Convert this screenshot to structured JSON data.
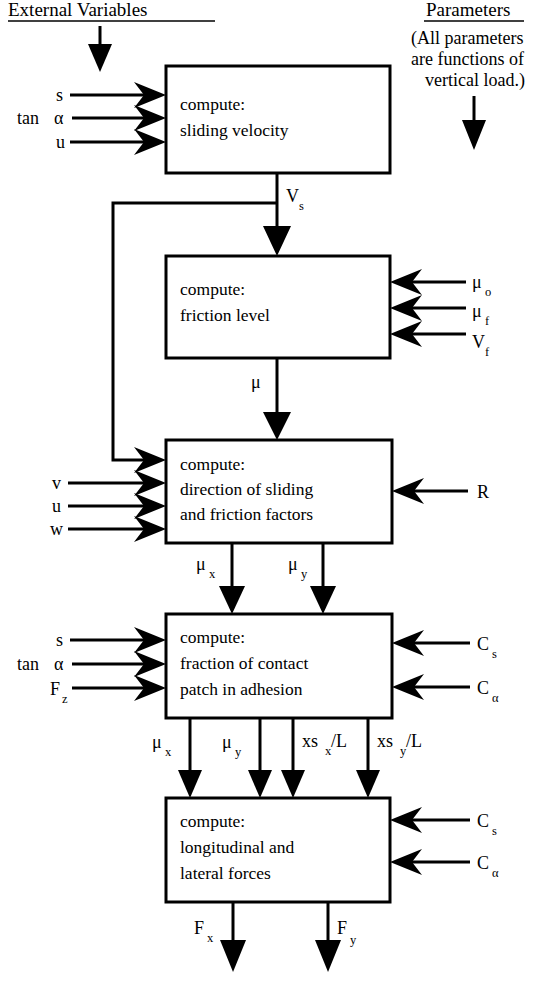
{
  "diagram": {
    "title_left": "External Variables",
    "title_right": "Parameters",
    "note_right": [
      "(All parameters",
      "are functions of",
      "vertical load.)"
    ],
    "blocks": [
      {
        "id": "sliding-velocity",
        "lines": [
          "compute:",
          "sliding velocity"
        ],
        "inputs_left": [
          "s",
          "tan α",
          "u"
        ],
        "inputs_right": [],
        "outputs_bottom": [
          "V_s"
        ]
      },
      {
        "id": "friction-level",
        "lines": [
          "compute:",
          "friction level"
        ],
        "inputs_left": [],
        "inputs_right": [
          "μ_o",
          "μ_f",
          "V_f"
        ],
        "outputs_bottom": [
          "μ"
        ]
      },
      {
        "id": "direction-of-sliding",
        "lines": [
          "compute:",
          "direction of sliding",
          "and friction factors"
        ],
        "inputs_left": [
          "v",
          "u",
          "w"
        ],
        "inputs_right": [
          "R"
        ],
        "outputs_bottom": [
          "μ_x",
          "μ_y"
        ]
      },
      {
        "id": "fraction-of-contact-patch",
        "lines": [
          "compute:",
          "fraction of contact",
          "patch in adhesion"
        ],
        "inputs_left": [
          "s",
          "tan α",
          "F_z"
        ],
        "inputs_right": [
          "C_s",
          "C_α"
        ],
        "outputs_bottom": [
          "μ_x",
          "μ_y",
          "xs_x/L",
          "xs_y/L"
        ]
      },
      {
        "id": "longitudinal-lateral-forces",
        "lines": [
          "compute:",
          "longitudinal and",
          "lateral forces"
        ],
        "inputs_left": [],
        "inputs_right": [
          "C_s",
          "C_α"
        ],
        "outputs_bottom": [
          "F_x",
          "F_y"
        ]
      }
    ],
    "labels": {
      "b1_in1": "s",
      "b1_in2_main": "tan",
      "b1_in2_greek": "α",
      "b1_in3": "u",
      "b1_line1": "compute:",
      "b1_line2": "sliding velocity",
      "b1_out_base": "V",
      "b1_out_sub": "s",
      "b2_line1": "compute:",
      "b2_line2": "friction level",
      "b2_in1_base": "μ",
      "b2_in1_sub": "o",
      "b2_in2_base": "μ",
      "b2_in2_sub": "f",
      "b2_in3_base": "V",
      "b2_in3_sub": "f",
      "b2_out": "μ",
      "b3_line1": "compute:",
      "b3_line2": "direction of sliding",
      "b3_line3": "and friction factors",
      "b3_in1": "v",
      "b3_in2": "u",
      "b3_in3": "w",
      "b3_in_right": "R",
      "b3_out1_base": "μ",
      "b3_out1_sub": "x",
      "b3_out2_base": "μ",
      "b3_out2_sub": "y",
      "b4_line1": "compute:",
      "b4_line2": "fraction of contact",
      "b4_line3": "patch in adhesion",
      "b4_in1": "s",
      "b4_in2_main": "tan",
      "b4_in2_greek": "α",
      "b4_in3_base": "F",
      "b4_in3_sub": "z",
      "b4_inr1_base": "C",
      "b4_inr1_sub": "s",
      "b4_inr2_base": "C",
      "b4_inr2_sub": "α",
      "b4_out1_base": "μ",
      "b4_out1_sub": "x",
      "b4_out2_base": "μ",
      "b4_out2_sub": "y",
      "b4_out3_base": "xs",
      "b4_out3_sub": "x",
      "b4_out3_tail": "/L",
      "b4_out4_base": "xs",
      "b4_out4_sub": "y",
      "b4_out4_tail": "/L",
      "b5_line1": "compute:",
      "b5_line2": "longitudinal and",
      "b5_line3": "lateral forces",
      "b5_inr1_base": "C",
      "b5_inr1_sub": "s",
      "b5_inr2_base": "C",
      "b5_inr2_sub": "α",
      "b5_out1_base": "F",
      "b5_out1_sub": "x",
      "b5_out2_base": "F",
      "b5_out2_sub": "y",
      "hdr_left": "External Variables",
      "hdr_right": "Parameters",
      "note1": "(All parameters",
      "note2": "are functions of",
      "note3": "vertical load.)"
    },
    "colors": {
      "ink": "#000000",
      "paper": "#ffffff"
    }
  }
}
